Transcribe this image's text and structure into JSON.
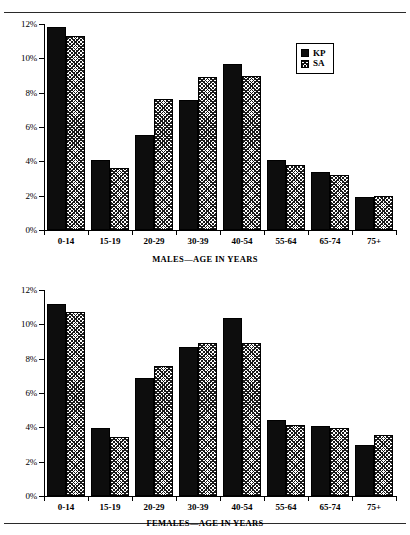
{
  "figure": {
    "background": "#ffffff",
    "ink": "#000000",
    "top_rule": true,
    "bottom_rule": true
  },
  "legend": {
    "position": "top-right",
    "entries": [
      {
        "label": "KP",
        "swatch": "solid-black-swatch",
        "color": "#0d0d0d"
      },
      {
        "label": "SA",
        "swatch": "hatched-swatch",
        "color": "#1a1a1a"
      }
    ]
  },
  "y_axis": {
    "ticks": [
      "0%",
      "2%",
      "4%",
      "6%",
      "8%",
      "10%",
      "12%"
    ],
    "min": 0,
    "max": 12
  },
  "chart_data": [
    {
      "type": "bar",
      "id": "males",
      "title": "",
      "xlabel": "MALES—AGE IN YEARS",
      "ylabel": "",
      "ylim": [
        0,
        12
      ],
      "ytick_labels": [
        "0%",
        "2%",
        "4%",
        "6%",
        "8%",
        "10%",
        "12%"
      ],
      "grid": false,
      "legend_position": "top-right",
      "categories": [
        "0-14",
        "15-19",
        "20-29",
        "30-39",
        "40-54",
        "55-64",
        "65-74",
        "75+"
      ],
      "series": [
        {
          "name": "KP",
          "values": [
            11.8,
            4.1,
            5.55,
            7.6,
            9.65,
            4.05,
            3.4,
            1.95
          ]
        },
        {
          "name": "SA",
          "values": [
            11.3,
            3.6,
            7.65,
            8.9,
            8.95,
            3.8,
            3.2,
            2.0
          ]
        }
      ]
    },
    {
      "type": "bar",
      "id": "females",
      "title": "",
      "xlabel": "FEMALES—AGE IN YEARS",
      "ylabel": "",
      "ylim": [
        0,
        12
      ],
      "ytick_labels": [
        "0%",
        "2%",
        "4%",
        "6%",
        "8%",
        "10%",
        "12%"
      ],
      "grid": false,
      "legend_position": "none",
      "categories": [
        "0-14",
        "15-19",
        "20-29",
        "30-39",
        "40-54",
        "55-64",
        "65-74",
        "75+"
      ],
      "series": [
        {
          "name": "KP",
          "values": [
            11.2,
            3.95,
            6.85,
            8.7,
            10.35,
            4.45,
            4.1,
            3.0
          ]
        },
        {
          "name": "SA",
          "values": [
            10.7,
            3.45,
            7.6,
            8.9,
            8.9,
            4.15,
            3.95,
            3.55
          ]
        }
      ]
    }
  ]
}
